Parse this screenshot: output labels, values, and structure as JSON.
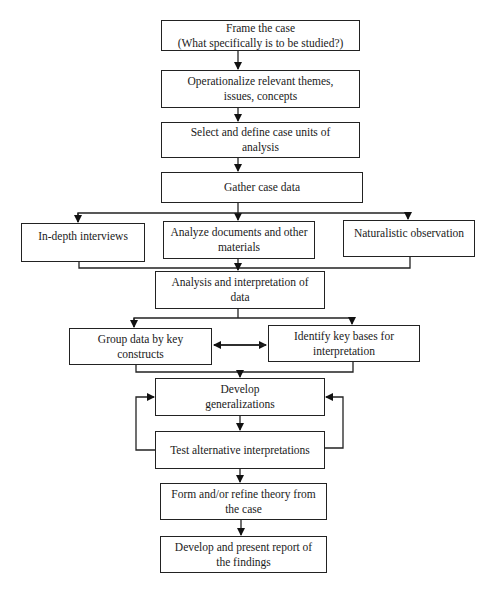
{
  "flowchart": {
    "nodes": {
      "frame": {
        "line1": "Frame the case",
        "line2": "(What specifically is to be studied?)"
      },
      "operationalize": {
        "line1": "Operationalize relevant themes,",
        "line2": "issues, concepts"
      },
      "select": {
        "line1": "Select and define case units of",
        "line2": "analysis"
      },
      "gather": {
        "line1": "Gather case data"
      },
      "interviews": {
        "line1": "In-depth interviews"
      },
      "documents": {
        "line1": "Analyze documents and other",
        "line2": "materials"
      },
      "observation": {
        "line1": "Naturalistic observation"
      },
      "analysis": {
        "line1": "Analysis and interpretation of data"
      },
      "group": {
        "line1": "Group data by key constructs"
      },
      "identify": {
        "line1": "Identify key bases for",
        "line2": "interpretation"
      },
      "generalize": {
        "line1": "Develop",
        "line2": "generalizations"
      },
      "test": {
        "line1": "Test alternative interpretations"
      },
      "theory": {
        "line1": "Form and/or refine theory from",
        "line2": "the case"
      },
      "report": {
        "line1": "Develop and present report of",
        "line2": "the findings"
      }
    },
    "edges": [
      [
        "frame",
        "operationalize"
      ],
      [
        "operationalize",
        "select"
      ],
      [
        "select",
        "gather"
      ],
      [
        "gather",
        "interviews"
      ],
      [
        "gather",
        "documents"
      ],
      [
        "gather",
        "observation"
      ],
      [
        "interviews",
        "analysis"
      ],
      [
        "documents",
        "analysis"
      ],
      [
        "observation",
        "analysis"
      ],
      [
        "analysis",
        "group"
      ],
      [
        "analysis",
        "identify"
      ],
      [
        "group",
        "identify",
        "bidirectional"
      ],
      [
        "group",
        "generalize"
      ],
      [
        "identify",
        "generalize"
      ],
      [
        "generalize",
        "test"
      ],
      [
        "test",
        "generalize",
        "feedback-left"
      ],
      [
        "test",
        "generalize",
        "feedback-right"
      ],
      [
        "test",
        "theory"
      ],
      [
        "theory",
        "report"
      ]
    ]
  }
}
